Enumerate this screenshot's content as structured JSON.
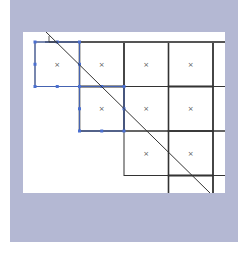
{
  "figure": {
    "background_color": "#b4b8d3",
    "canvas_color": "#ffffff",
    "line_color": "#333333",
    "selection_color": "#4a6fd0",
    "cell_marker": "×",
    "grid": {
      "origin_x": 12,
      "origin_y": 10,
      "cell_size": 44.5,
      "rows": [
        {
          "row": 0,
          "start_col": 0,
          "end_col": 5
        },
        {
          "row": 1,
          "start_col": 1,
          "end_col": 5
        },
        {
          "row": 2,
          "start_col": 2,
          "end_col": 5
        },
        {
          "row": 3,
          "start_col": 3,
          "end_col": 5
        }
      ],
      "cells_with_markers": [
        [
          0,
          0
        ],
        [
          0,
          1
        ],
        [
          0,
          2
        ],
        [
          0,
          3
        ],
        [
          1,
          1
        ],
        [
          1,
          2
        ],
        [
          1,
          3
        ],
        [
          2,
          2
        ],
        [
          2,
          3
        ]
      ],
      "selected_cells": [
        [
          0,
          0
        ],
        [
          1,
          1
        ]
      ]
    },
    "diagonal": {
      "x1": 23,
      "y1": 0,
      "x2": 187,
      "y2": 161
    }
  }
}
